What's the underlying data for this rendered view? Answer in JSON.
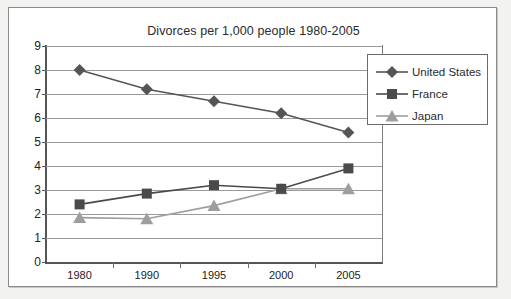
{
  "chart_data": {
    "type": "line",
    "title": "Divorces per 1,000 people 1980-2005",
    "xlabel": "",
    "ylabel": "",
    "categories": [
      "1980",
      "1990",
      "1995",
      "2000",
      "2005"
    ],
    "ylim": [
      0,
      9
    ],
    "ytick_step": 1,
    "yticks": [
      "9",
      "8",
      "7",
      "6",
      "5",
      "4",
      "3",
      "2",
      "1",
      "0"
    ],
    "grid": true,
    "legend_position": "top-right",
    "series": [
      {
        "name": "United States",
        "marker": "diamond",
        "color": "#555555",
        "values": [
          8.0,
          7.2,
          6.7,
          6.2,
          5.4
        ]
      },
      {
        "name": "France",
        "marker": "square",
        "color": "#4a4a4a",
        "values": [
          2.4,
          2.85,
          3.2,
          3.05,
          3.9
        ]
      },
      {
        "name": "Japan",
        "marker": "triangle",
        "color": "#9e9e9e",
        "values": [
          1.85,
          1.8,
          2.35,
          3.05,
          3.05
        ]
      }
    ]
  },
  "colors": {
    "page_background": "#f2f2f0",
    "paper": "#ffffff",
    "gridline": "#9a9a9a",
    "axis": "#555555",
    "text": "#2b2b2b",
    "united_states": "#555555",
    "france": "#4a4a4a",
    "japan": "#9e9e9e"
  }
}
